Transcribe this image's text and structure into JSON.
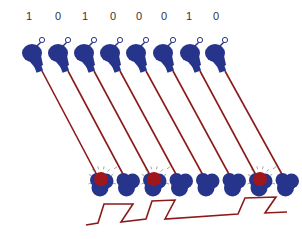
{
  "diagram": {
    "bits": [
      "1",
      "0",
      "1",
      "0",
      "0",
      "0",
      "1",
      "0"
    ],
    "colors": {
      "bulb": "#27348b",
      "wire": "#8b1a1a",
      "lit": "#a0161b",
      "glow": "#9a9a9a",
      "signal": "#8b1a1a",
      "label": "#333333"
    },
    "transmitters": [
      {
        "x": 32,
        "y": 53,
        "label_x": 29
      },
      {
        "x": 58,
        "y": 53,
        "label_x": 58
      },
      {
        "x": 84,
        "y": 53,
        "label_x": 85
      },
      {
        "x": 110,
        "y": 53,
        "label_x": 113
      },
      {
        "x": 136,
        "y": 53,
        "label_x": 139
      },
      {
        "x": 163,
        "y": 53,
        "label_x": 164
      },
      {
        "x": 190,
        "y": 53,
        "label_x": 189
      },
      {
        "x": 215,
        "y": 53,
        "label_x": 216
      }
    ],
    "receivers_lit_indices": [
      0,
      2,
      6
    ],
    "waveform_label": ""
  }
}
